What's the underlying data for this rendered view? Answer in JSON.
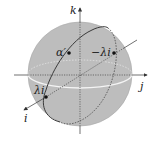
{
  "diagram": {
    "type": "unit-sphere-quaternion",
    "colors": {
      "sphere_fill": "#bdbdbd",
      "sphere_edge": "#a8a8a8",
      "axis": "#333333",
      "great_circle": "#3a3a3a",
      "equator": "#f2f2f2",
      "point": "#111111"
    },
    "axes": {
      "i": "i",
      "j": "j",
      "k": "k"
    },
    "points": [
      {
        "label": "α′",
        "x": 69,
        "y": 53
      },
      {
        "label": "−λi",
        "x": 114,
        "y": 53
      },
      {
        "label": "λi",
        "x": 46,
        "y": 97
      }
    ]
  }
}
